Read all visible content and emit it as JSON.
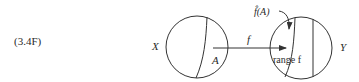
{
  "equation_label": "(3.4F)",
  "domain_set": {
    "label": "X",
    "subset_label": "A"
  },
  "codomain_set": {
    "label": "Y",
    "image_label": "f̂(A)",
    "range_label": "range f"
  },
  "map": {
    "label": "f"
  },
  "colors": {
    "stroke": "#333333",
    "text": "#2a2a2a",
    "background": "#ffffff"
  }
}
